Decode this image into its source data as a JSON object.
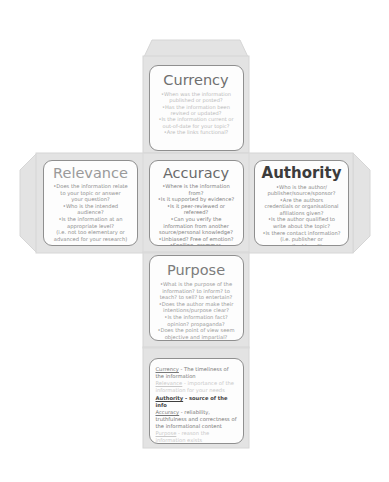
{
  "document": {
    "type": "cube-net-template",
    "subject": "CRAAP test evaluation cube",
    "background_color": "#ffffff",
    "net_fill_color": "#e3e3e3",
    "net_stroke_color": "#cfcfcf",
    "panel_fill_color": "#fdfdfd",
    "panel_stroke_color": "#8f8f8f"
  },
  "faces": {
    "currency": {
      "title": "Currency",
      "title_color": "#6f6f6f",
      "bullets": [
        "•When was the information",
        "published or posted?",
        "•Has the information been",
        "revised or updated?",
        "•Is the information current or",
        "out-of-date for your topic?",
        "•Are the links functional?"
      ]
    },
    "relevance": {
      "title": "Relevance",
      "title_color": "#9a9a9a",
      "bullets": [
        "•Does the information relate",
        "to your topic or answer",
        "your question?",
        "•Who is the intended",
        "audience?",
        "•Is the information at an",
        "appropriate level?",
        "(i.e. not too elementary or",
        "advanced for your research)"
      ]
    },
    "accuracy": {
      "title": "Accuracy",
      "title_color": "#6a6a6a",
      "bullets": [
        "•Where is the information from?",
        "•Is it supported by evidence?",
        "•Is it peer-reviewed or refereed?",
        "•Can you verify the",
        "information from another",
        "source/personal knowledge?",
        "•Unbiased? Free of emotion?",
        "•Spelling, grammar,",
        "typographical errors?"
      ]
    },
    "authority": {
      "title": "Authority",
      "title_color": "#3c3c3c",
      "bullets": [
        "•Who is the author/",
        "publisher/source/sponsor?",
        "•Are the authors",
        "credentials or organisational",
        "afiliations given?",
        "•Is the author qualified to",
        "write about the topic?",
        "•Is there contact information?",
        "(i.e. publisher or",
        "email address?)"
      ]
    },
    "purpose": {
      "title": "Purpose",
      "title_color": "#7c7c7c",
      "bullets": [
        "•What is the purpose of the",
        "information? to inform? to",
        "teach? to sell? to entertain?",
        "•Does the author make their",
        "intentions/purpose clear?",
        "•Is the information fact?",
        "opinion? propaganda?",
        "•Does the point of view seem",
        "objective and impartial?"
      ]
    }
  },
  "summary": {
    "entries": [
      {
        "term": "Currency",
        "definition": " - The timeliness of the information",
        "emphasis": "mid"
      },
      {
        "term": "Relevance",
        "definition": " - importance of the information for your needs",
        "emphasis": "faint"
      },
      {
        "term": "Authority",
        "definition": " - source of the info",
        "emphasis": "strong"
      },
      {
        "term": "Accuracy",
        "definition": " - reliability, truthfulness and correctness of the informational content",
        "emphasis": "mid"
      },
      {
        "term": "Purpose",
        "definition": " - reason the information exists",
        "emphasis": "faint"
      }
    ]
  }
}
